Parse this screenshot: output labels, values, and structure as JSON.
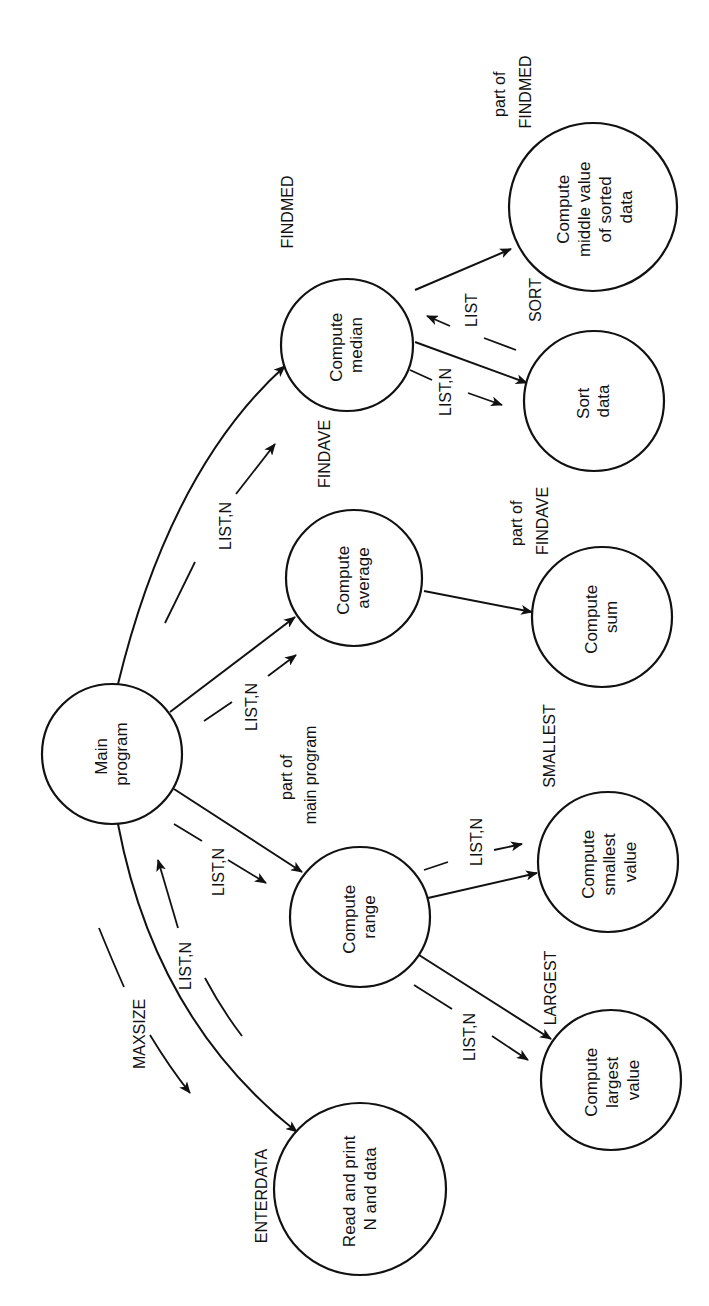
{
  "diagram": {
    "type": "structure-chart",
    "orientation": "rotated-90-ccw",
    "nodes": [
      {
        "id": "main",
        "lines": [
          "Main",
          "program"
        ]
      },
      {
        "id": "median",
        "lines": [
          "Compute",
          "median"
        ],
        "module": "FINDMED"
      },
      {
        "id": "middle",
        "lines": [
          "Compute",
          "middle value",
          "of sorted",
          "data"
        ],
        "module_lines": [
          "part of",
          "FINDMED"
        ]
      },
      {
        "id": "sort",
        "lines": [
          "Sort",
          "data"
        ],
        "module": "SORT"
      },
      {
        "id": "average",
        "lines": [
          "Compute",
          "average"
        ],
        "module": "FINDAVE"
      },
      {
        "id": "sum",
        "lines": [
          "Compute",
          "sum"
        ],
        "module_lines": [
          "part of",
          "FINDAVE"
        ]
      },
      {
        "id": "range",
        "lines": [
          "Compute",
          "range"
        ],
        "module_lines": [
          "part of",
          "main program"
        ]
      },
      {
        "id": "smallest",
        "lines": [
          "Compute",
          "smallest",
          "value"
        ],
        "module": "SMALLEST"
      },
      {
        "id": "largest",
        "lines": [
          "Compute",
          "largest",
          "value"
        ],
        "module": "LARGEST"
      },
      {
        "id": "enterdata",
        "lines": [
          "Read and print",
          "N and data"
        ],
        "module": "ENTERDATA"
      }
    ],
    "edges": [
      {
        "from": "main",
        "to": "median"
      },
      {
        "from": "main",
        "to": "average"
      },
      {
        "from": "main",
        "to": "range"
      },
      {
        "from": "main",
        "to": "enterdata"
      },
      {
        "from": "median",
        "to": "middle"
      },
      {
        "from": "median",
        "to": "sort"
      },
      {
        "from": "average",
        "to": "sum"
      },
      {
        "from": "range",
        "to": "smallest"
      },
      {
        "from": "range",
        "to": "largest"
      }
    ],
    "flows": [
      {
        "label": "LIST,N",
        "direction": "main->median"
      },
      {
        "label": "LIST,N",
        "direction": "main->average"
      },
      {
        "label": "LIST,N",
        "direction": "main->range"
      },
      {
        "label": "MAXSIZE",
        "direction": "main->enterdata"
      },
      {
        "label": "LIST,N",
        "direction": "enterdata->main"
      },
      {
        "label": "LIST,N",
        "direction": "median->sort"
      },
      {
        "label": "LIST",
        "direction": "sort->median"
      },
      {
        "label": "LIST,N",
        "direction": "range->smallest"
      },
      {
        "label": "LIST,N",
        "direction": "range->largest"
      }
    ]
  },
  "labels": {
    "main": [
      "Main",
      "program"
    ],
    "median": [
      "Compute",
      "median"
    ],
    "middle": [
      "Compute",
      "middle value",
      "of sorted",
      "data"
    ],
    "sort": [
      "Sort",
      "data"
    ],
    "average": [
      "Compute",
      "average"
    ],
    "sum": [
      "Compute",
      "sum"
    ],
    "range": [
      "Compute",
      "range"
    ],
    "smallest": [
      "Compute",
      "smallest",
      "value"
    ],
    "largest": [
      "Compute",
      "largest",
      "value"
    ],
    "enterdata": [
      "Read and print",
      "N and data"
    ],
    "mod_findmed": "FINDMED",
    "mod_part_findmed": [
      "part of",
      "FINDMED"
    ],
    "mod_sort": "SORT",
    "mod_findave": "FINDAVE",
    "mod_part_findave": [
      "part of",
      "FINDAVE"
    ],
    "mod_part_main": [
      "part of",
      "main program"
    ],
    "mod_smallest": "SMALLEST",
    "mod_largest": "LARGEST",
    "mod_enterdata": "ENTERDATA",
    "flow_listn": "LIST,N",
    "flow_list": "LIST",
    "flow_maxsize": "MAXSIZE"
  }
}
